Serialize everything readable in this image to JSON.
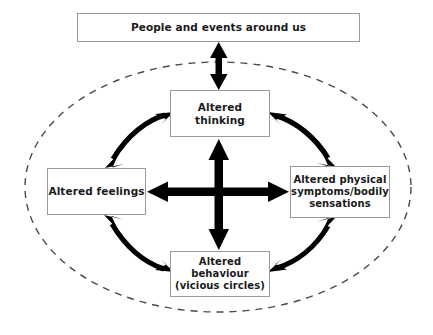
{
  "diagram": {
    "type": "cbt-hot-cross-bun-model",
    "background_color": "#ffffff",
    "box_border_color": "#9a9a9a",
    "text_color": "#1a1a1a",
    "arrow_color": "#000000",
    "boundary": {
      "shape": "ellipse",
      "stroke": "dashed",
      "color": "#4a4a4a",
      "center_x": 218,
      "center_y": 187,
      "radius_x": 193,
      "radius_y": 125
    },
    "nodes": {
      "context": {
        "label": "People and events around us"
      },
      "thinking": {
        "label": "Altered thinking"
      },
      "feelings": {
        "label": "Altered feelings"
      },
      "physical": {
        "label": "Altered physical\nsymptoms/bodily\nsensations"
      },
      "behaviour": {
        "label": "Altered behaviour\n(vicious circles)"
      }
    },
    "connectors": [
      {
        "name": "context-to-thinking",
        "from": "context",
        "to": "thinking",
        "style": "straight",
        "heads": "double",
        "orientation": "vertical"
      },
      {
        "name": "thinking-to-behaviour",
        "from": "thinking",
        "to": "behaviour",
        "style": "straight",
        "heads": "double",
        "orientation": "vertical"
      },
      {
        "name": "feelings-to-physical",
        "from": "feelings",
        "to": "physical",
        "style": "straight",
        "heads": "double",
        "orientation": "horizontal"
      },
      {
        "name": "feelings-to-thinking",
        "from": "feelings",
        "to": "thinking",
        "style": "curved",
        "heads": "double",
        "quadrant": "upper-left"
      },
      {
        "name": "thinking-to-physical",
        "from": "thinking",
        "to": "physical",
        "style": "curved",
        "heads": "double",
        "quadrant": "upper-right"
      },
      {
        "name": "feelings-to-behaviour",
        "from": "feelings",
        "to": "behaviour",
        "style": "curved",
        "heads": "double",
        "quadrant": "lower-left"
      },
      {
        "name": "behaviour-to-physical",
        "from": "behaviour",
        "to": "physical",
        "style": "curved",
        "heads": "double",
        "quadrant": "lower-right"
      }
    ]
  }
}
